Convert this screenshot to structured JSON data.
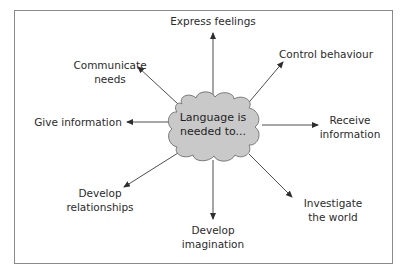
{
  "diagram": {
    "center": {
      "line1": "Language is",
      "line2": "needed to..."
    },
    "nodes": [
      {
        "id": "express-feelings",
        "line1": "Express feelings",
        "line2": ""
      },
      {
        "id": "control-behaviour",
        "line1": "Control behaviour",
        "line2": ""
      },
      {
        "id": "receive-information",
        "line1": "Receive",
        "line2": "information"
      },
      {
        "id": "investigate-the-world",
        "line1": "Investigate",
        "line2": "the world"
      },
      {
        "id": "develop-imagination",
        "line1": "Develop",
        "line2": "imagination"
      },
      {
        "id": "develop-relationships",
        "line1": "Develop",
        "line2": "relationships"
      },
      {
        "id": "give-information",
        "line1": "Give information",
        "line2": ""
      },
      {
        "id": "communicate-needs",
        "line1": "Communicate",
        "line2": "needs"
      }
    ],
    "colors": {
      "cloud_fill": "#c9c9c9",
      "cloud_stroke": "#6e6e6e",
      "arrow": "#3a3a3a",
      "frame": "#8a8a8a"
    }
  }
}
